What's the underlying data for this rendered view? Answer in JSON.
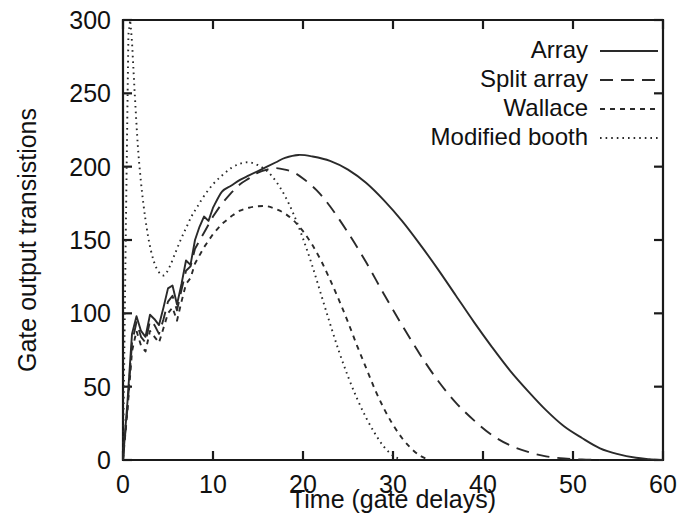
{
  "chart_data": {
    "type": "line",
    "title": "",
    "xlabel": "Time (gate delays)",
    "ylabel": "Gate output transistions",
    "xlim": [
      0,
      60
    ],
    "ylim": [
      0,
      300
    ],
    "xticks": [
      0,
      10,
      20,
      30,
      40,
      50,
      60
    ],
    "yticks": [
      0,
      50,
      100,
      150,
      200,
      250,
      300
    ],
    "xtick_labels": [
      "0",
      "10",
      "20",
      "30",
      "40",
      "50",
      "60"
    ],
    "ytick_labels": [
      "0",
      "50",
      "100",
      "150",
      "200",
      "250",
      "300"
    ],
    "grid": false,
    "legend_position": "top-right",
    "series": [
      {
        "name": "Array",
        "dash": "none",
        "x": [
          0,
          0.5,
          1.0,
          1.5,
          2.0,
          2.5,
          3.0,
          3.5,
          4.0,
          4.5,
          5.0,
          5.5,
          6.0,
          6.5,
          7.0,
          7.5,
          8.0,
          8.5,
          9.0,
          9.5,
          10.0,
          11.0,
          12.0,
          13.0,
          14.0,
          15.0,
          16.0,
          17.0,
          18.0,
          19.5,
          21.0,
          23.0,
          25.0,
          27.0,
          29.0,
          31.0,
          33.0,
          35.0,
          37.0,
          39.0,
          41.0,
          43.0,
          45.0,
          47.0,
          49.0,
          51.0,
          53.0,
          55.0,
          57.0,
          58.5,
          60.0
        ],
        "y": [
          0,
          40,
          86,
          98,
          88,
          84,
          99,
          96,
          92,
          104,
          117,
          119,
          106,
          120,
          136,
          133,
          150,
          159,
          166,
          163,
          172,
          183,
          187,
          191,
          194,
          197,
          200,
          203,
          206,
          208,
          207,
          204,
          198,
          189,
          177,
          163,
          147,
          130,
          112,
          94,
          77,
          61,
          47,
          34,
          23,
          15,
          8,
          4,
          1.5,
          0.6,
          0
        ]
      },
      {
        "name": "Split array",
        "dash": "dashed",
        "x": [
          0,
          0.5,
          1.0,
          1.5,
          2.0,
          2.5,
          3.0,
          3.5,
          4.0,
          4.5,
          5.0,
          5.5,
          6.0,
          6.5,
          7.0,
          7.5,
          8.0,
          9.0,
          10.0,
          11.0,
          12.0,
          13.0,
          14.0,
          15.0,
          16.0,
          17.0,
          18.0,
          19.0,
          20.0,
          21.5,
          23.0,
          25.0,
          27.0,
          29.0,
          31.0,
          33.0,
          35.0,
          37.0,
          39.0,
          41.0,
          43.0,
          45.0,
          47.0,
          49.0,
          51.0,
          53.0
        ],
        "y": [
          0,
          36,
          80,
          94,
          84,
          80,
          95,
          92,
          86,
          96,
          108,
          112,
          102,
          116,
          129,
          132,
          144,
          155,
          166,
          175,
          182,
          188,
          192,
          196,
          198,
          199,
          198,
          196,
          192,
          184,
          173,
          155,
          135,
          113,
          92,
          72,
          54,
          39,
          27,
          17,
          10,
          5.5,
          2.5,
          1,
          0.3,
          0
        ]
      },
      {
        "name": "Wallace",
        "dash": "short-dash",
        "x": [
          0,
          0.5,
          1.0,
          1.5,
          2.0,
          2.5,
          3.0,
          3.5,
          4.0,
          4.5,
          5.0,
          5.5,
          6.0,
          6.5,
          7.0,
          7.5,
          8.0,
          9.0,
          10.0,
          11.0,
          12.0,
          13.0,
          14.0,
          15.0,
          16.0,
          17.0,
          18.0,
          19.0,
          20.0,
          21.0,
          22.0,
          23.0,
          24.0,
          25.0,
          26.0,
          27.0,
          28.0,
          29.0,
          30.0,
          31.0,
          32.0,
          33.0,
          34.0
        ],
        "y": [
          0,
          34,
          74,
          88,
          78,
          74,
          88,
          84,
          80,
          90,
          100,
          104,
          95,
          108,
          120,
          124,
          134,
          145,
          154,
          161,
          166,
          170,
          172,
          173,
          173,
          171,
          168,
          163,
          156,
          147,
          136,
          123,
          109,
          94,
          78,
          63,
          48,
          35,
          24,
          15,
          8,
          3,
          0
        ]
      },
      {
        "name": "Modified booth",
        "dash": "dotted",
        "x": [
          0,
          0.3,
          0.6,
          0.8,
          1.0,
          1.3,
          1.7,
          2.2,
          2.8,
          3.4,
          4.0,
          4.6,
          5.2,
          5.8,
          6.4,
          7.0,
          7.6,
          8.2,
          9.0,
          10.0,
          11.0,
          12.0,
          13.0,
          14.0,
          15.0,
          16.0,
          17.0,
          18.0,
          19.0,
          20.0,
          21.0,
          22.0,
          23.0,
          24.0,
          25.0,
          26.0,
          27.0,
          28.0,
          29.0,
          30.0,
          31.0
        ],
        "y": [
          0,
          150,
          290,
          300,
          285,
          250,
          210,
          178,
          152,
          136,
          128,
          126,
          132,
          141,
          150,
          158,
          166,
          172,
          180,
          188,
          194,
          199,
          202,
          203,
          201,
          197,
          190,
          180,
          167,
          151,
          133,
          113,
          93,
          74,
          57,
          42,
          29,
          18,
          9,
          3,
          0
        ]
      }
    ]
  },
  "legend": {
    "entries": [
      {
        "label": "Array",
        "dash": "none"
      },
      {
        "label": "Split array",
        "dash": "dashed"
      },
      {
        "label": "Wallace",
        "dash": "short-dash"
      },
      {
        "label": "Modified booth",
        "dash": "dotted"
      }
    ]
  }
}
